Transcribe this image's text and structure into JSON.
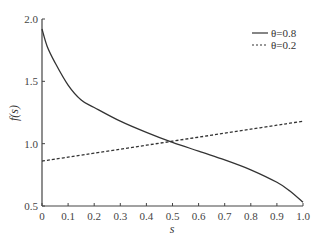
{
  "chart_data": {
    "type": "line",
    "title": "",
    "xlabel": "s",
    "ylabel": "f(s)",
    "xlim": [
      0,
      1.0
    ],
    "ylim": [
      0.5,
      2.0
    ],
    "grid": false,
    "legend_position": "upper right",
    "x_ticks": [
      "0",
      "0.1",
      "0.2",
      "0.3",
      "0.4",
      "0.5",
      "0.6",
      "0.7",
      "0.8",
      "0.9",
      "1.0"
    ],
    "y_ticks": [
      "0.5",
      "1.0",
      "1.5",
      "2.0"
    ],
    "x": [
      0,
      0.02,
      0.05,
      0.1,
      0.15,
      0.2,
      0.3,
      0.4,
      0.5,
      0.6,
      0.7,
      0.8,
      0.9,
      0.95,
      1.0
    ],
    "series": [
      {
        "name": "θ=0.8",
        "style": "solid",
        "values": [
          1.92,
          1.78,
          1.65,
          1.47,
          1.35,
          1.29,
          1.18,
          1.09,
          1.01,
          0.94,
          0.87,
          0.79,
          0.69,
          0.62,
          0.53
        ]
      },
      {
        "name": "θ=0.2",
        "style": "dashed",
        "values": [
          0.86,
          0.866,
          0.876,
          0.892,
          0.908,
          0.924,
          0.956,
          0.988,
          1.02,
          1.052,
          1.084,
          1.116,
          1.148,
          1.164,
          1.18
        ]
      }
    ]
  },
  "legend": {
    "items": [
      {
        "label": "θ=0.8",
        "style": "solid"
      },
      {
        "label": "θ=0.2",
        "style": "dashed"
      }
    ]
  },
  "axes": {
    "xlabel": "s",
    "ylabel": "f(s)"
  },
  "colors": {
    "line": "#333333",
    "axis": "#444444"
  }
}
